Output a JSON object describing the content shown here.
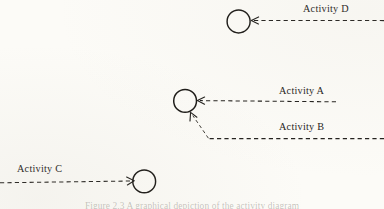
{
  "figure": {
    "type": "activity-diagram",
    "background_color": "#fcfbf7",
    "ink_color": "#1c1a18",
    "caption": "Figure 2.3  A graphical depiction of the activity diagram"
  },
  "nodes": [
    {
      "id": "node-d",
      "name": "activity-d-node",
      "cx": 238.5,
      "cy": 21.5,
      "r": 11.6
    },
    {
      "id": "node-a",
      "name": "activity-a-node",
      "cx": 185.0,
      "cy": 101.0,
      "r": 11.4
    },
    {
      "id": "node-c",
      "name": "activity-c-node",
      "cx": 144.0,
      "cy": 181.5,
      "r": 11.4
    }
  ],
  "edges": [
    {
      "id": "edge-d",
      "label": "Activity D",
      "direction": "right-to-left",
      "arrowhead_at": {
        "x": 252,
        "y": 20.5
      },
      "path": "M 384 20.5 L 253 20.5",
      "label_position": {
        "x": 303,
        "y": 4
      }
    },
    {
      "id": "edge-a",
      "label": "Activity A",
      "direction": "right-to-left",
      "arrowhead_at": {
        "x": 198,
        "y": 100.5
      },
      "path": "M 336 101.5 L 199 100.5",
      "label_position": {
        "x": 279,
        "y": 86
      }
    },
    {
      "id": "edge-b",
      "label": "Activity B",
      "direction": "right-to-upper-left",
      "arrowhead_at": {
        "x": 190,
        "y": 113
      },
      "path": "M 384 138.5 L 208 138.5 L 191.5 114",
      "label_position": {
        "x": 279,
        "y": 122
      }
    },
    {
      "id": "edge-c",
      "label": "Activity C",
      "direction": "left-to-right",
      "arrowhead_at": {
        "x": 133,
        "y": 181
      },
      "path": "M 0 182.5 L 132 181",
      "label_position": {
        "x": 17,
        "y": 164
      }
    }
  ],
  "labels": {
    "activity_a": "Activity A",
    "activity_b": "Activity B",
    "activity_c": "Activity C",
    "activity_d": "Activity D"
  }
}
